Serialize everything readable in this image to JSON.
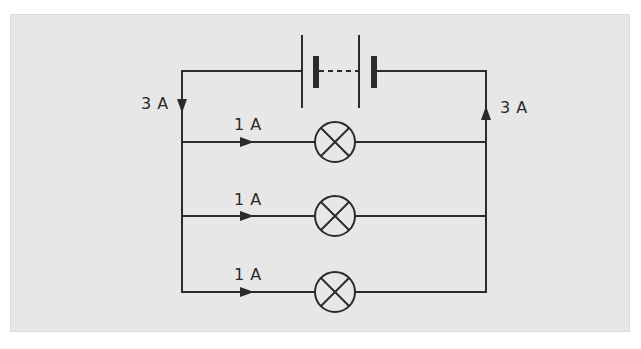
{
  "diagram": {
    "type": "circuit",
    "background_color": "#e7e7e7",
    "wire_color": "#2b2b2b",
    "components": {
      "battery": {
        "cells": 2,
        "joined_by": "dashed-line"
      },
      "lamps": 3
    },
    "labels": {
      "left_main_current": "3 A",
      "right_main_current": "3 A",
      "branch_currents": [
        "1 A",
        "1 A",
        "1 A"
      ]
    }
  }
}
